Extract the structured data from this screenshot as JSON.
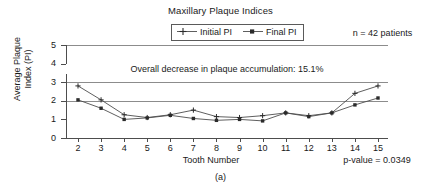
{
  "figure": {
    "caption": "(a)"
  },
  "chart_data": {
    "type": "line",
    "title": "Maxillary Plaque Indices",
    "xlabel": "Tooth Number",
    "ylabel_line1": "Average Plaque",
    "ylabel_line2": "Index (PI)",
    "x": [
      2,
      3,
      4,
      5,
      6,
      7,
      8,
      9,
      10,
      11,
      12,
      13,
      14,
      15
    ],
    "categories": [
      "2",
      "3",
      "4",
      "5",
      "6",
      "7",
      "8",
      "9",
      "10",
      "11",
      "12",
      "13",
      "14",
      "15"
    ],
    "series": [
      {
        "name": "Initial PI",
        "marker": "plus",
        "color": "#4d4d4d",
        "values": [
          2.8,
          2.05,
          1.25,
          1.1,
          1.25,
          1.5,
          1.15,
          1.1,
          1.2,
          1.35,
          1.2,
          1.35,
          2.4,
          2.8
        ]
      },
      {
        "name": "Final PI",
        "marker": "filled-square",
        "color": "#4d4d4d",
        "values": [
          2.05,
          1.6,
          1.0,
          1.08,
          1.22,
          1.05,
          0.95,
          1.0,
          0.92,
          1.35,
          1.15,
          1.35,
          1.78,
          2.15
        ]
      }
    ],
    "ylim": [
      0,
      5
    ],
    "yticks": [
      0,
      1,
      2,
      3,
      4,
      5
    ],
    "ytick_labels": [
      "0",
      "1",
      "2",
      "3",
      "4",
      "5"
    ],
    "gridlines_at": [
      2,
      3,
      4,
      5
    ],
    "grid": true,
    "legend_position": "top-center",
    "annotations": {
      "in_plot": "Overall decrease in plaque accumulation: 15.1%",
      "sample_size": "n = 42 patients",
      "p_value": "p-value = 0.0349"
    }
  }
}
